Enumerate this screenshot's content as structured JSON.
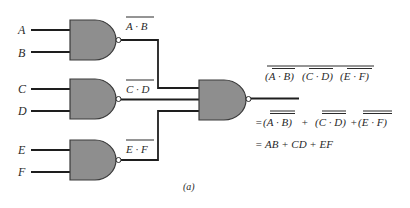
{
  "diagram": {
    "type": "logic-circuit",
    "caption": "(a)",
    "inputs": [
      {
        "name": "A",
        "label": "A"
      },
      {
        "name": "B",
        "label": "B"
      },
      {
        "name": "C",
        "label": "C"
      },
      {
        "name": "D",
        "label": "D"
      },
      {
        "name": "E",
        "label": "E"
      },
      {
        "name": "F",
        "label": "F"
      }
    ],
    "gates": [
      {
        "id": "nand1",
        "type": "NAND",
        "inputs": [
          "A",
          "B"
        ],
        "output_label": "A · B"
      },
      {
        "id": "nand2",
        "type": "NAND",
        "inputs": [
          "C",
          "D"
        ],
        "output_label": "C · D"
      },
      {
        "id": "nand3",
        "type": "NAND",
        "inputs": [
          "E",
          "F"
        ],
        "output_label": "E · F"
      },
      {
        "id": "nand4",
        "type": "NAND",
        "inputs": [
          "nand1",
          "nand2",
          "nand3"
        ]
      }
    ],
    "expressions": {
      "line1": {
        "t1": "(A · B)",
        "t2": "(C · D)",
        "t3": "(E · F)"
      },
      "line2": {
        "prefix": "=",
        "t1": "(A · B)",
        "plus1": "+",
        "t2": "(C · D)",
        "plus2": "+",
        "t3": "(E  · F)"
      },
      "line3": "= AB + CD + EF"
    },
    "colors": {
      "gate_fill": "#8e8e8e",
      "wire": "#1e1e1e",
      "text": "#2a2a2a",
      "background": "#ffffff"
    }
  }
}
